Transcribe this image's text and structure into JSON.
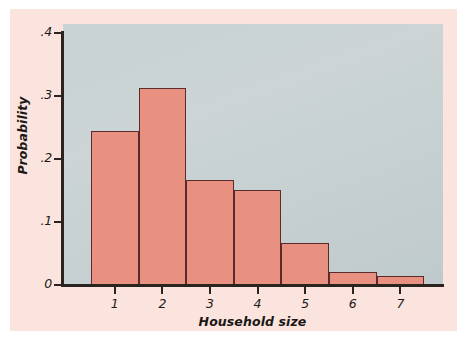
{
  "chart_data": {
    "type": "bar",
    "title": "",
    "subtitle": "",
    "xlabel": "Household size",
    "ylabel": "Probability",
    "categories": [
      "1",
      "2",
      "3",
      "4",
      "5",
      "6",
      "7"
    ],
    "values": [
      0.245,
      0.312,
      0.167,
      0.151,
      0.066,
      0.021,
      0.014
    ],
    "series": [
      {
        "name": "Probability",
        "values": [
          0.245,
          0.312,
          0.167,
          0.151,
          0.066,
          0.021,
          0.014
        ]
      }
    ],
    "xlim": [
      0.5,
      7.5
    ],
    "ylim": [
      0,
      0.4
    ],
    "ytick_labels": [
      "0",
      ".1",
      ".2",
      ".3",
      ".4"
    ],
    "ytick_values": [
      0,
      0.1,
      0.2,
      0.3,
      0.4
    ],
    "xtick_labels": [
      "1",
      "2",
      "3",
      "4",
      "5",
      "6",
      "7"
    ],
    "grid": false,
    "legend": false,
    "legend_position": "none",
    "bar_color": "#e89181",
    "bar_edge_color": "#5a2b2a",
    "plot_background_color": "#c9d3d4",
    "figure_background_color": "#fbe4de",
    "page_background_color": "#ffffff",
    "axis_color": "#2b2320",
    "annotations": []
  }
}
